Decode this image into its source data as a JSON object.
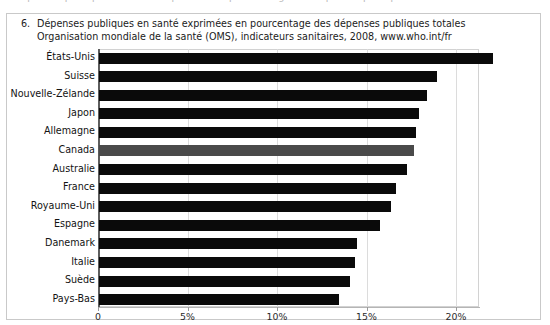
{
  "top_bleed_text": "Dépenses publiques en santé exprimées en pourcentage des dépenses publiques totales",
  "caption": {
    "number": "6.",
    "line1": "Dépenses publiques en santé exprimées en pourcentage des dépenses publiques totales",
    "line2": "Organisation mondiale de la santé (OMS), indicateurs sanitaires, 2008, www.who.int/fr"
  },
  "colors": {
    "bar": "#0a0a0a",
    "highlight_bar": "#4a4a4a",
    "grid": "#dcdcdc",
    "frame": "#c9c9c9",
    "axis": "#5d5d5d"
  },
  "chart_data": {
    "type": "bar",
    "orientation": "horizontal",
    "title": "Dépenses publiques en santé exprimées en pourcentage des dépenses publiques totales",
    "subtitle": "Organisation mondiale de la santé (OMS), indicateurs sanitaires, 2008, www.who.int/fr",
    "xlabel": "",
    "ylabel": "",
    "xlim": [
      0,
      23
    ],
    "grid": true,
    "legend": "none",
    "highlight_category": "Canada",
    "tick_values": [
      0,
      5,
      10,
      15,
      20
    ],
    "tick_labels": [
      "0",
      "5%",
      "10%",
      "15%",
      "20%"
    ],
    "categories": [
      "États-Unis",
      "Suisse",
      "Nouvelle-Zélande",
      "Japon",
      "Allemagne",
      "Canada",
      "Australie",
      "France",
      "Royaume-Uni",
      "Espagne",
      "Danemark",
      "Italie",
      "Suède",
      "Pays-Bas"
    ],
    "values": [
      22.0,
      18.9,
      18.3,
      17.9,
      17.7,
      17.6,
      17.2,
      16.6,
      16.3,
      15.7,
      14.4,
      14.3,
      14.0,
      13.4
    ]
  }
}
